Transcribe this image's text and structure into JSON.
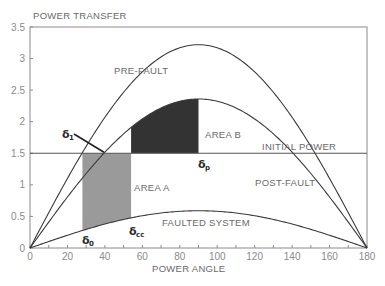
{
  "chart_data": {
    "type": "line",
    "title": "POWER TRANSFER",
    "xlabel": "POWER ANGLE",
    "ylabel": "POWER TRANSFER",
    "xlim": [
      0,
      180
    ],
    "ylim": [
      0,
      3.5
    ],
    "x_ticks": [
      0,
      20,
      40,
      60,
      80,
      100,
      120,
      140,
      160,
      180
    ],
    "x_minor_step": 10,
    "y_ticks": [
      0,
      0.5,
      1,
      1.5,
      2,
      2.5,
      3,
      3.5
    ],
    "y_tick_labels": [
      "0",
      "0.5",
      "1",
      "1.5",
      "2",
      "2.5",
      "3",
      "3.5"
    ],
    "grid": false,
    "series": [
      {
        "name": "PRE-FAULT",
        "form": "Pmax*sin(delta)",
        "pmax": 3.22
      },
      {
        "name": "POST-FAULT",
        "form": "Pmax*sin(delta)",
        "pmax": 2.36
      },
      {
        "name": "FAULTED SYSTEM",
        "form": "Pmax*sin(delta)",
        "pmax": 0.59
      },
      {
        "name": "INITIAL POWER",
        "form": "constant",
        "value": 1.5
      }
    ],
    "shaded_areas": [
      {
        "name": "AREA A",
        "from_deg": 28,
        "to_deg": 54,
        "between": [
          "FAULTED SYSTEM",
          "INITIAL POWER"
        ],
        "color": "#9a9a9a"
      },
      {
        "name": "AREA B",
        "from_deg": 54,
        "to_deg": 90,
        "between": [
          "INITIAL POWER",
          "POST-FAULT"
        ],
        "color": "#333333"
      }
    ],
    "annotations": [
      {
        "text": "δ0",
        "label": "δ",
        "sub": "0",
        "x_deg": 28
      },
      {
        "text": "δcc",
        "label": "δ",
        "sub": "cc",
        "x_deg": 54
      },
      {
        "text": "δp",
        "label": "δ",
        "sub": "p",
        "x_deg": 90
      },
      {
        "text": "δ1",
        "label": "δ",
        "sub": "1",
        "x_deg": 39.5,
        "arrow": true
      }
    ]
  },
  "labels": {
    "title": "POWER TRANSFER",
    "xlabel": "POWER ANGLE",
    "prefault": "PRE-FAULT",
    "postfault": "POST-FAULT",
    "faulted": "FAULTED SYSTEM",
    "initial": "INITIAL POWER",
    "area_a": "AREA A",
    "area_b": "AREA B",
    "delta": "δ",
    "d0_sub": "0",
    "dcc_sub": "cc",
    "dp_sub": "p",
    "d1_sub": "1"
  },
  "colors": {
    "axis": "#8c8c8c",
    "curve": "#3a3a3a",
    "area_a": "#9a9a9a",
    "area_b": "#333333",
    "initial_line": "#555555"
  }
}
